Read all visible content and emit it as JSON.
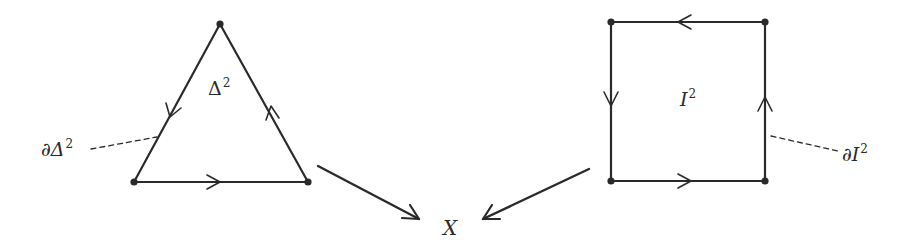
{
  "diagram": {
    "type": "commutative-diagram",
    "colors": {
      "stroke": "#2a2a2a",
      "background": "#ffffff"
    },
    "triangle": {
      "label_base": "Δ",
      "label_exp": "2",
      "boundary_label_prefix": "∂Δ",
      "boundary_label_exp": "2",
      "vertices": [
        [
          220,
          24
        ],
        [
          134,
          182
        ],
        [
          308,
          182
        ]
      ]
    },
    "square": {
      "label_base": "I",
      "label_exp": "2",
      "boundary_label_prefix": "∂I",
      "boundary_label_exp": "2",
      "corners": [
        [
          611,
          22
        ],
        [
          765,
          22
        ],
        [
          765,
          181
        ],
        [
          611,
          181
        ]
      ]
    },
    "target": {
      "label": "X"
    },
    "maps": [
      {
        "from": "triangle",
        "to": "X"
      },
      {
        "from": "square",
        "to": "X"
      }
    ]
  }
}
